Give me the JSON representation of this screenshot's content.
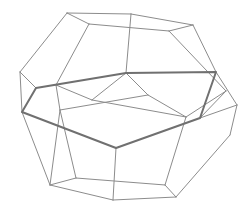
{
  "figure": {
    "colors": {
      "background": "#ffffff",
      "edge": "#8c8c8c",
      "highlight": "#707070"
    },
    "vertices": {
      "t1": [
        67,
        13
      ],
      "t2": [
        131,
        14
      ],
      "t3": [
        193,
        25
      ],
      "t4": [
        89,
        24
      ],
      "t5": [
        169,
        31
      ],
      "g": [
        20,
        72
      ],
      "h": [
        36,
        88
      ],
      "f": [
        126,
        73
      ],
      "i": [
        216,
        72
      ],
      "j": [
        226,
        91
      ],
      "k": [
        22,
        112
      ],
      "m": [
        56,
        85
      ],
      "n": [
        60,
        110
      ],
      "p": [
        92,
        100
      ],
      "q": [
        148,
        95
      ],
      "r": [
        186,
        117
      ],
      "s": [
        200,
        118
      ],
      "u": [
        237,
        105
      ],
      "v": [
        116,
        148
      ],
      "w": [
        230,
        135
      ],
      "b1": [
        50,
        185
      ],
      "b2": [
        76,
        178
      ],
      "b3": [
        113,
        200
      ],
      "b4": [
        165,
        185
      ],
      "b5": [
        176,
        197
      ],
      "b6": [
        201,
        138
      ],
      "b7": [
        128,
        210
      ]
    },
    "edges": [
      [
        "t1",
        "t2"
      ],
      [
        "t2",
        "t3"
      ],
      [
        "t1",
        "t4"
      ],
      [
        "t4",
        "t5"
      ],
      [
        "t5",
        "t3"
      ],
      [
        "t2",
        "f"
      ],
      [
        "t1",
        "g"
      ],
      [
        "t4",
        "m"
      ],
      [
        "t5",
        "j"
      ],
      [
        "t3",
        "i"
      ],
      [
        "i",
        "u"
      ],
      [
        "g",
        "h"
      ],
      [
        "g",
        "k"
      ],
      [
        "m",
        "n"
      ],
      [
        "m",
        "p"
      ],
      [
        "f",
        "p"
      ],
      [
        "f",
        "q"
      ],
      [
        "p",
        "r"
      ],
      [
        "q",
        "r"
      ],
      [
        "n",
        "b1"
      ],
      [
        "r",
        "b4"
      ],
      [
        "j",
        "r"
      ],
      [
        "u",
        "w"
      ],
      [
        "w",
        "b5"
      ],
      [
        "k",
        "b1"
      ],
      [
        "b1",
        "b3"
      ],
      [
        "b2",
        "b1"
      ],
      [
        "b2",
        "n"
      ],
      [
        "b2",
        "b4"
      ],
      [
        "b4",
        "b5"
      ],
      [
        "b3",
        "b5"
      ],
      [
        "v",
        "b3"
      ],
      [
        "s",
        "u"
      ],
      [
        "j",
        "s"
      ],
      [
        "n",
        "q"
      ]
    ],
    "highlight_path": [
      "h",
      "f",
      "i",
      "s",
      "v",
      "k",
      "h"
    ]
  }
}
